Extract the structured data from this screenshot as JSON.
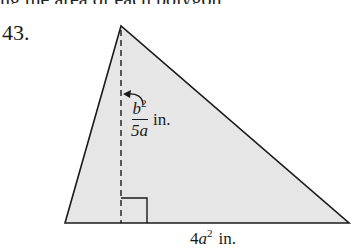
{
  "header": {
    "remnant_text": "ng the area of each polygon"
  },
  "problem": {
    "number": "43."
  },
  "figure": {
    "shape": "triangle",
    "fill_color": "#e6e6e6",
    "stroke_color": "#1a1a1a",
    "vertices": {
      "apex": [
        121,
        26
      ],
      "bottom_left": [
        65,
        223
      ],
      "bottom_right": [
        349,
        223
      ]
    },
    "altitude": {
      "style": "dashed",
      "x": 121,
      "from_y": 28,
      "to_y": 223
    },
    "right_angle_marker": {
      "x": 121,
      "y": 198,
      "size": 26
    },
    "height_label": {
      "numerator_base": "b",
      "numerator_exp": "2",
      "denominator": "5a",
      "unit": "in."
    },
    "base_label": {
      "coefficient": "4",
      "variable": "a",
      "exponent": "2",
      "unit": "in."
    }
  }
}
